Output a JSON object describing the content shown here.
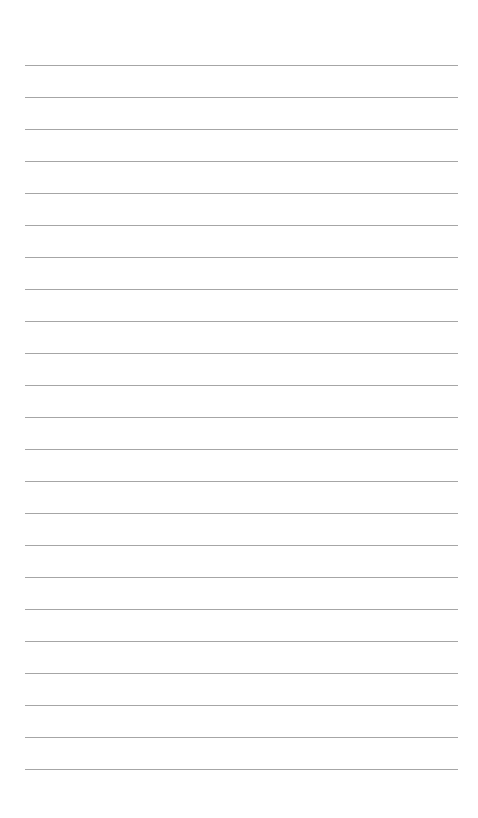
{
  "page": {
    "type": "lined-paper",
    "background": "#ffffff",
    "line_color": "#a6a6a6",
    "line_count": 23,
    "first_line_y": 65,
    "line_spacing": 32,
    "line_left": 25,
    "line_right": 458
  }
}
